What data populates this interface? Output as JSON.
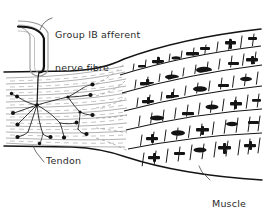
{
  "figure": {
    "type": "anatomical-line-drawing",
    "background_color": "#ffffff",
    "ink_color": "#1a1a1a",
    "width": 264,
    "height": 212
  },
  "labels": {
    "nerve": "Group IB afferent\nnerve fibre",
    "nerve_line1": "Group IB afferent",
    "nerve_line2": "nerve fibre",
    "tendon": "Tendon",
    "muscle": "Muscle\nfibres",
    "muscle_line1": "Muscle",
    "muscle_line2": "fibres"
  },
  "structures": {
    "nerve_fibre": {
      "name": "Group IB afferent nerve fibre",
      "description": "myelinated axon entering from upper left, curving down into tendon",
      "stroke": "#111111"
    },
    "nerve_sheath": {
      "name": "perineural sheath",
      "stroke": "#8a8a8a"
    },
    "nerve_terminals": {
      "name": "branching sensory endings with terminal knobs",
      "knob_count": 16,
      "knob_color": "#111111"
    },
    "tendon": {
      "name": "Tendon",
      "description": "collagen fibre bundles, fine wavy horizontal lines",
      "stroke": "#6d6d6d"
    },
    "muscle_fibres": {
      "name": "Muscle fibres",
      "description": "six striated fibre bands fanning out to the right",
      "band_count": 6,
      "striation_color": "#161616"
    }
  }
}
